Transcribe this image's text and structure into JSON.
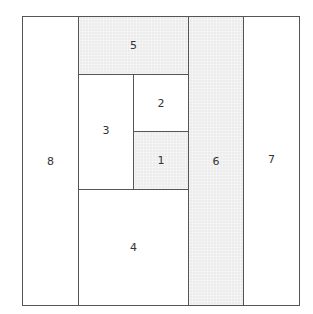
{
  "diagram": {
    "colors": {
      "border": "#555555",
      "shaded": "#ececec",
      "plain": "#ffffff"
    },
    "regions": [
      {
        "id": "8",
        "label": "8",
        "shaded": false
      },
      {
        "id": "5",
        "label": "5",
        "shaded": true
      },
      {
        "id": "3",
        "label": "3",
        "shaded": false
      },
      {
        "id": "2",
        "label": "2",
        "shaded": false
      },
      {
        "id": "1",
        "label": "1",
        "shaded": true
      },
      {
        "id": "4",
        "label": "4",
        "shaded": false
      },
      {
        "id": "6",
        "label": "6",
        "shaded": true
      },
      {
        "id": "7",
        "label": "7",
        "shaded": false
      }
    ]
  }
}
